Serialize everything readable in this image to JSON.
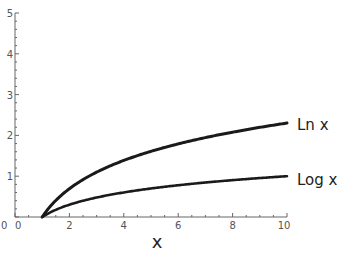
{
  "chart_data": {
    "type": "line",
    "title": "",
    "xlabel": "x",
    "ylabel": "",
    "xlim": [
      0,
      10
    ],
    "ylim": [
      0,
      5
    ],
    "x_ticks": [
      0,
      2,
      4,
      6,
      8,
      10
    ],
    "y_ticks": [
      0,
      1,
      2,
      3,
      4,
      5
    ],
    "grid": false,
    "legend_position": "inline-right",
    "series": [
      {
        "name": "Ln x",
        "function": "ln(x)",
        "x": [
          1,
          2,
          3,
          4,
          5,
          6,
          7,
          8,
          9,
          10
        ],
        "values": [
          0,
          0.693,
          1.099,
          1.386,
          1.609,
          1.792,
          1.946,
          2.079,
          2.197,
          2.303
        ]
      },
      {
        "name": "Log x",
        "function": "log10(x)",
        "x": [
          1,
          2,
          3,
          4,
          5,
          6,
          7,
          8,
          9,
          10
        ],
        "values": [
          0,
          0.301,
          0.477,
          0.602,
          0.699,
          0.778,
          0.845,
          0.903,
          0.954,
          1.0
        ]
      }
    ]
  },
  "labels": {
    "origin_y": "0",
    "series_ln": "Ln x",
    "series_log": "Log x",
    "x_axis_title": "x"
  }
}
